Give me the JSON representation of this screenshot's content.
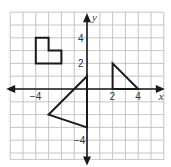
{
  "diagram": {
    "type": "coordinate-plane",
    "axes": {
      "x_label": "x",
      "y_label": "y",
      "x_ticks": [
        {
          "value": -4,
          "label": "−4"
        },
        {
          "value": 2,
          "label": "2"
        },
        {
          "value": 4,
          "label": "4"
        }
      ],
      "y_ticks": [
        {
          "value": 4,
          "label": "4"
        },
        {
          "value": 2,
          "label": "2"
        },
        {
          "value": -4,
          "label": "−4"
        }
      ],
      "x_range": [
        -6,
        6
      ],
      "y_range": [
        -5.5,
        6
      ],
      "grid": true
    },
    "shapes": [
      {
        "name": "l-shaped-hexagon",
        "vertices": [
          [
            -4,
            4
          ],
          [
            -3,
            4
          ],
          [
            -3,
            3
          ],
          [
            -2,
            3
          ],
          [
            -2,
            2
          ],
          [
            -4,
            2
          ]
        ]
      },
      {
        "name": "large-triangle",
        "vertices": [
          [
            0,
            1
          ],
          [
            -3,
            -2
          ],
          [
            0,
            -3
          ]
        ]
      },
      {
        "name": "small-right-triangle",
        "vertices": [
          [
            2,
            2
          ],
          [
            2,
            0
          ],
          [
            4,
            0
          ]
        ]
      }
    ],
    "colors": {
      "grid": "#b8b8b8",
      "axis": "#1a1a1a",
      "shape_stroke": "#1a1a1a"
    }
  }
}
